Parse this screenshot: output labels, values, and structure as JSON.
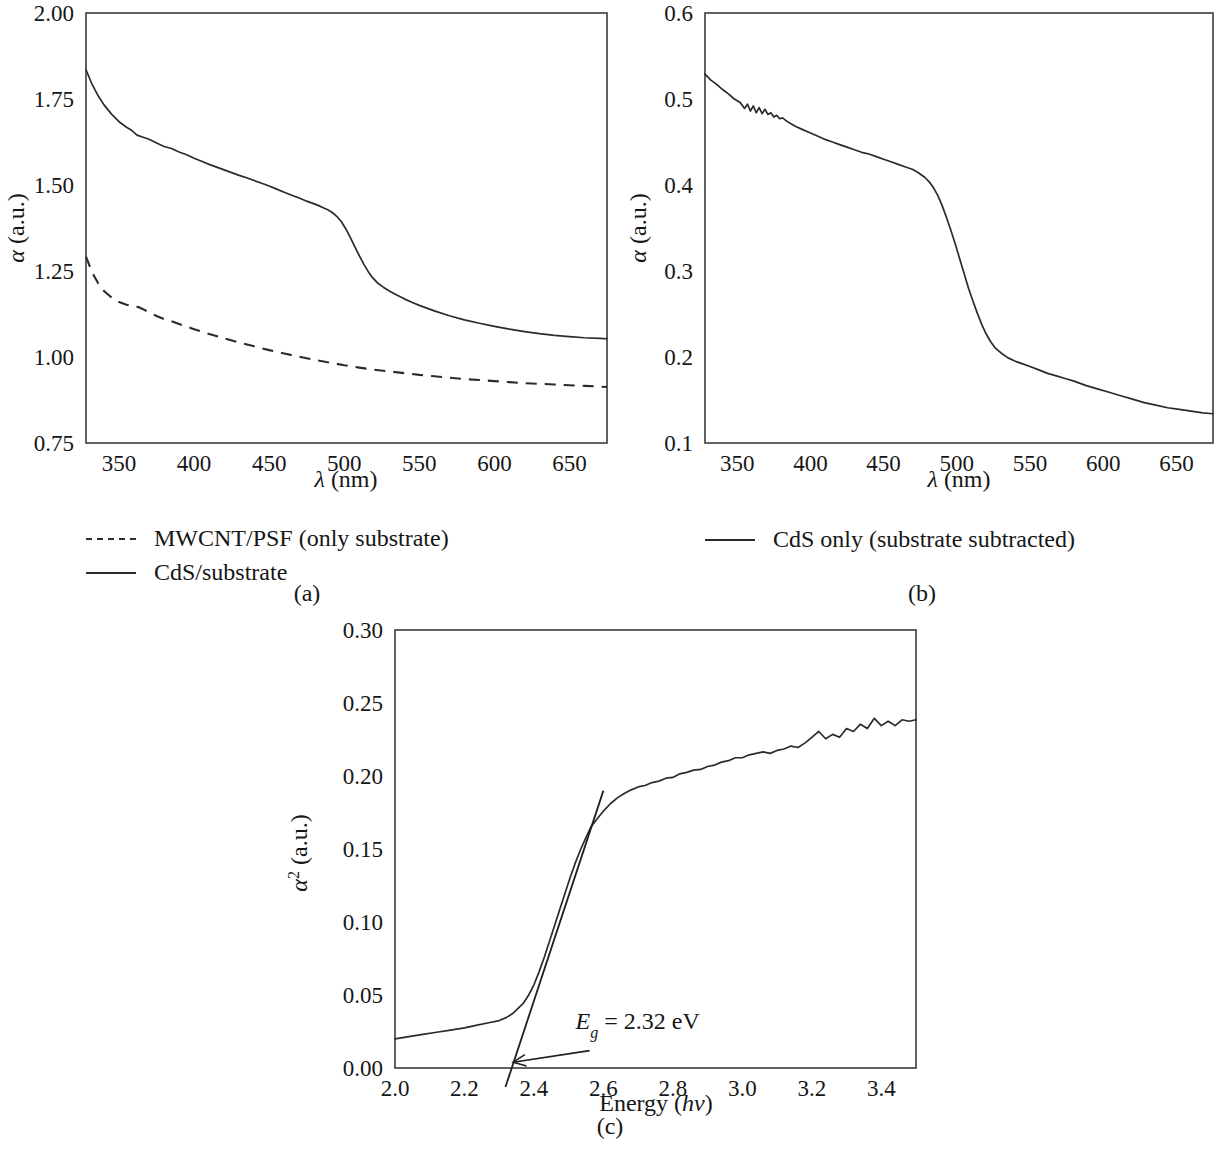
{
  "figure": {
    "panels": [
      {
        "id": "a",
        "subcaption": "(a)",
        "xlabel_symbol": "λ",
        "xlabel_unit": " (nm)",
        "ylabel_symbol": "α",
        "ylabel_unit": " (a.u.)",
        "legend": [
          {
            "label": "MWCNT/PSF (only substrate)",
            "style": "dashed"
          },
          {
            "label": "CdS/substrate",
            "style": "solid"
          }
        ]
      },
      {
        "id": "b",
        "subcaption": "(b)",
        "xlabel_symbol": "λ",
        "xlabel_unit": " (nm)",
        "ylabel_symbol": "α",
        "ylabel_unit": " (a.u.)",
        "legend": [
          {
            "label": "CdS only (substrate subtracted)",
            "style": "solid"
          }
        ]
      },
      {
        "id": "c",
        "subcaption": "(c)",
        "xlabel_text": "Energy (",
        "xlabel_italic": "hν",
        "xlabel_tail": ")",
        "ylabel_symbol": "α",
        "ylabel_sup": "2",
        "ylabel_unit": " (a.u.)",
        "annotation": {
          "symbol": "E",
          "subscript": "g",
          "equals": "=",
          "value": "2.32 eV"
        },
        "legend": []
      }
    ],
    "colors": {
      "curve": "#2b2b2b",
      "axis": "#3a3a3a",
      "text": "#161616",
      "background": "#ffffff"
    }
  },
  "chart_data": [
    {
      "id": "a",
      "type": "line",
      "title": "",
      "xlabel": "λ (nm)",
      "ylabel": "α (a.u.)",
      "xlim": [
        328,
        675
      ],
      "ylim": [
        0.75,
        2.0
      ],
      "xticks": [
        350,
        400,
        450,
        500,
        550,
        600,
        650
      ],
      "yticks": [
        0.75,
        1.0,
        1.25,
        1.5,
        1.75,
        2.0
      ],
      "xtick_labels": [
        "350",
        "400",
        "450",
        "500",
        "550",
        "600",
        "650"
      ],
      "ytick_labels": [
        "0.75",
        "1.00",
        "1.25",
        "1.50",
        "1.75",
        "2.00"
      ],
      "grid": false,
      "legend_position": "below-left",
      "series": [
        {
          "name": "CdS/substrate",
          "style": "solid",
          "x": [
            328,
            332,
            336,
            340,
            345,
            350,
            355,
            358,
            362,
            366,
            370,
            375,
            380,
            385,
            390,
            395,
            400,
            405,
            410,
            415,
            420,
            425,
            430,
            435,
            440,
            445,
            450,
            455,
            460,
            465,
            470,
            475,
            480,
            483,
            486,
            489,
            492,
            495,
            498,
            501,
            504,
            507,
            510,
            513,
            516,
            519,
            522,
            526,
            530,
            535,
            540,
            545,
            550,
            560,
            570,
            580,
            590,
            600,
            610,
            620,
            630,
            640,
            650,
            660,
            670,
            675
          ],
          "y": [
            1.835,
            1.793,
            1.76,
            1.733,
            1.706,
            1.684,
            1.668,
            1.66,
            1.645,
            1.639,
            1.633,
            1.622,
            1.612,
            1.606,
            1.596,
            1.588,
            1.578,
            1.569,
            1.56,
            1.552,
            1.544,
            1.536,
            1.528,
            1.521,
            1.513,
            1.505,
            1.497,
            1.488,
            1.479,
            1.47,
            1.462,
            1.453,
            1.445,
            1.44,
            1.434,
            1.428,
            1.42,
            1.409,
            1.394,
            1.373,
            1.348,
            1.321,
            1.295,
            1.27,
            1.248,
            1.23,
            1.216,
            1.203,
            1.192,
            1.18,
            1.169,
            1.159,
            1.15,
            1.134,
            1.12,
            1.108,
            1.098,
            1.089,
            1.081,
            1.074,
            1.068,
            1.063,
            1.059,
            1.056,
            1.054,
            1.053
          ]
        },
        {
          "name": "MWCNT/PSF (only substrate)",
          "style": "dashed",
          "x": [
            328,
            332,
            336,
            340,
            345,
            350,
            355,
            358,
            360,
            363,
            366,
            370,
            375,
            380,
            385,
            390,
            395,
            400,
            410,
            420,
            430,
            440,
            450,
            460,
            470,
            480,
            490,
            500,
            510,
            520,
            530,
            540,
            550,
            560,
            570,
            580,
            590,
            600,
            610,
            620,
            630,
            640,
            650,
            660,
            670,
            675
          ],
          "y": [
            1.292,
            1.247,
            1.215,
            1.192,
            1.173,
            1.16,
            1.152,
            1.148,
            1.147,
            1.145,
            1.139,
            1.13,
            1.119,
            1.11,
            1.104,
            1.096,
            1.088,
            1.081,
            1.067,
            1.054,
            1.042,
            1.031,
            1.02,
            1.01,
            1.001,
            0.992,
            0.984,
            0.976,
            0.969,
            0.963,
            0.958,
            0.953,
            0.948,
            0.944,
            0.94,
            0.936,
            0.933,
            0.93,
            0.927,
            0.924,
            0.922,
            0.92,
            0.918,
            0.916,
            0.914,
            0.913
          ]
        }
      ]
    },
    {
      "id": "b",
      "type": "line",
      "title": "",
      "xlabel": "λ (nm)",
      "ylabel": "α (a.u.)",
      "xlim": [
        328,
        675
      ],
      "ylim": [
        0.1,
        0.6
      ],
      "xticks": [
        350,
        400,
        450,
        500,
        550,
        600,
        650
      ],
      "yticks": [
        0.1,
        0.2,
        0.3,
        0.4,
        0.5,
        0.6
      ],
      "xtick_labels": [
        "350",
        "400",
        "450",
        "500",
        "550",
        "600",
        "650"
      ],
      "ytick_labels": [
        "0.1",
        "0.2",
        "0.3",
        "0.4",
        "0.5",
        "0.6"
      ],
      "grid": false,
      "legend_position": "below-center",
      "series": [
        {
          "name": "CdS only (substrate subtracted)",
          "style": "solid",
          "x": [
            328,
            332,
            336,
            340,
            344,
            348,
            352,
            355,
            357,
            359,
            361,
            363,
            365,
            367,
            369,
            371,
            373,
            375,
            377,
            379,
            381,
            384,
            387,
            390,
            394,
            398,
            402,
            406,
            410,
            415,
            420,
            425,
            430,
            435,
            440,
            445,
            450,
            455,
            460,
            465,
            470,
            474,
            478,
            481,
            484,
            487,
            490,
            493,
            496,
            499,
            502,
            505,
            508,
            511,
            514,
            517,
            520,
            523,
            526,
            530,
            535,
            540,
            545,
            550,
            556,
            562,
            568,
            574,
            580,
            588,
            596,
            604,
            612,
            620,
            628,
            636,
            644,
            652,
            660,
            668,
            675
          ],
          "y": [
            0.529,
            0.522,
            0.517,
            0.511,
            0.506,
            0.5,
            0.496,
            0.489,
            0.494,
            0.486,
            0.492,
            0.484,
            0.49,
            0.483,
            0.488,
            0.482,
            0.484,
            0.479,
            0.481,
            0.477,
            0.478,
            0.474,
            0.471,
            0.468,
            0.465,
            0.462,
            0.459,
            0.456,
            0.453,
            0.45,
            0.447,
            0.444,
            0.441,
            0.438,
            0.436,
            0.433,
            0.43,
            0.427,
            0.424,
            0.421,
            0.418,
            0.414,
            0.409,
            0.404,
            0.397,
            0.388,
            0.376,
            0.362,
            0.347,
            0.331,
            0.314,
            0.297,
            0.28,
            0.265,
            0.251,
            0.238,
            0.227,
            0.218,
            0.211,
            0.205,
            0.199,
            0.195,
            0.192,
            0.189,
            0.185,
            0.181,
            0.178,
            0.175,
            0.172,
            0.167,
            0.163,
            0.159,
            0.155,
            0.151,
            0.147,
            0.144,
            0.141,
            0.139,
            0.137,
            0.135,
            0.134
          ]
        }
      ]
    },
    {
      "id": "c",
      "type": "line",
      "title": "",
      "xlabel": "Energy (hν)",
      "ylabel": "α² (a.u.)",
      "xlim": [
        2.0,
        3.5
      ],
      "ylim": [
        0.0,
        0.3
      ],
      "xticks": [
        2.0,
        2.2,
        2.4,
        2.6,
        2.8,
        3.0,
        3.2,
        3.4
      ],
      "yticks": [
        0.0,
        0.05,
        0.1,
        0.15,
        0.2,
        0.25,
        0.3
      ],
      "xtick_labels": [
        "2.0",
        "2.2",
        "2.4",
        "2.6",
        "2.8",
        "3.0",
        "3.2",
        "3.4"
      ],
      "ytick_labels": [
        "0.00",
        "0.05",
        "0.10",
        "0.15",
        "0.20",
        "0.25",
        "0.30"
      ],
      "grid": false,
      "legend_position": "none",
      "annotations": [
        {
          "text": "E_g = 2.32 eV",
          "x": 2.52,
          "y": 0.027,
          "arrow_to_x": 2.34,
          "arrow_to_y": 0.004
        }
      ],
      "series": [
        {
          "name": "alpha^2 spectrum",
          "style": "solid",
          "x": [
            2.0,
            2.04,
            2.08,
            2.12,
            2.16,
            2.2,
            2.24,
            2.27,
            2.3,
            2.32,
            2.34,
            2.355,
            2.37,
            2.385,
            2.4,
            2.415,
            2.43,
            2.445,
            2.46,
            2.475,
            2.49,
            2.505,
            2.52,
            2.535,
            2.55,
            2.565,
            2.58,
            2.6,
            2.62,
            2.64,
            2.66,
            2.68,
            2.7,
            2.72,
            2.74,
            2.76,
            2.78,
            2.8,
            2.82,
            2.84,
            2.86,
            2.88,
            2.9,
            2.92,
            2.94,
            2.96,
            2.98,
            3.0,
            3.02,
            3.04,
            3.06,
            3.08,
            3.1,
            3.12,
            3.14,
            3.16,
            3.18,
            3.2,
            3.22,
            3.24,
            3.26,
            3.28,
            3.3,
            3.32,
            3.34,
            3.36,
            3.38,
            3.4,
            3.42,
            3.44,
            3.46,
            3.48,
            3.5
          ],
          "y": [
            0.02,
            0.0215,
            0.023,
            0.0245,
            0.026,
            0.0275,
            0.0295,
            0.031,
            0.0325,
            0.0345,
            0.0375,
            0.041,
            0.0445,
            0.05,
            0.057,
            0.066,
            0.076,
            0.087,
            0.098,
            0.109,
            0.12,
            0.131,
            0.141,
            0.15,
            0.158,
            0.1655,
            0.17,
            0.176,
            0.181,
            0.185,
            0.188,
            0.1905,
            0.1925,
            0.1935,
            0.1955,
            0.1965,
            0.1985,
            0.199,
            0.2015,
            0.2025,
            0.204,
            0.2045,
            0.2065,
            0.2075,
            0.2095,
            0.2105,
            0.2125,
            0.2125,
            0.2145,
            0.2155,
            0.2165,
            0.2155,
            0.2175,
            0.2185,
            0.2205,
            0.2195,
            0.2225,
            0.2265,
            0.2305,
            0.2255,
            0.2285,
            0.2265,
            0.2325,
            0.2305,
            0.2355,
            0.2325,
            0.2395,
            0.2345,
            0.2375,
            0.2345,
            0.2385,
            0.2375,
            0.2385
          ]
        },
        {
          "name": "tangent fit",
          "style": "solid-fit",
          "x": [
            2.318,
            2.6
          ],
          "y": [
            -0.013,
            0.19
          ]
        }
      ]
    }
  ]
}
